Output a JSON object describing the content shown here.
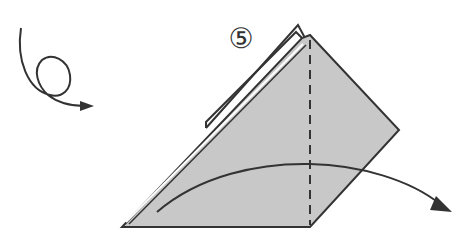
{
  "diagram": {
    "step_number": "5",
    "step_symbol": "⑤",
    "colors": {
      "paper_fill": "#c8c8c8",
      "line": "#333333",
      "background": "#ffffff"
    },
    "elements": [
      {
        "name": "turn-over-arrow",
        "description": "looped arrow indicating turn the model over"
      },
      {
        "name": "paper-shape",
        "description": "folded paper triangle/quadrilateral with layered edge"
      },
      {
        "name": "valley-fold-line",
        "description": "vertical dashed fold line"
      },
      {
        "name": "fold-direction-arrow",
        "description": "curved arrow showing the fold direction to the right"
      }
    ]
  }
}
